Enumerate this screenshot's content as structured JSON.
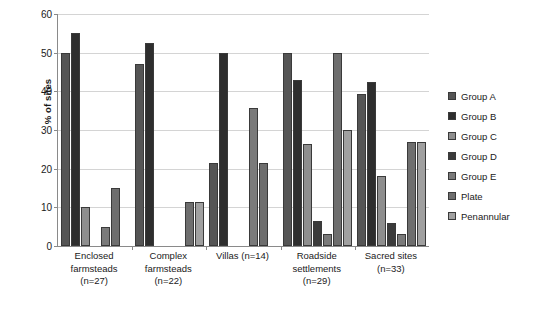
{
  "chart_data": {
    "type": "bar",
    "title": "",
    "xlabel": "",
    "ylabel": "% of sites",
    "ylim": [
      0,
      60
    ],
    "yticks": [
      0,
      10,
      20,
      30,
      40,
      50,
      60
    ],
    "grid": true,
    "legend_position": "right",
    "categories": [
      "Enclosed farmsteads (n=27)",
      "Complex farmsteads (n=22)",
      "Villas (n=14)",
      "Roadside settlements (n=29)",
      "Sacred sites (n=33)"
    ],
    "category_label_lines": [
      [
        "Enclosed",
        "farmsteads",
        "(n=27)"
      ],
      [
        "Complex",
        "farmsteads",
        "(n=22)"
      ],
      [
        "Villas (n=14)"
      ],
      [
        "Roadside",
        "settlements",
        "(n=29)"
      ],
      [
        "Sacred sites",
        "(n=33)"
      ]
    ],
    "series": [
      {
        "name": "Group A",
        "color": "#555555",
        "values": [
          50,
          47,
          21.4,
          50,
          39.4
        ]
      },
      {
        "name": "Group B",
        "color": "#2e2e2e",
        "values": [
          55,
          52.5,
          50,
          43,
          42.4
        ]
      },
      {
        "name": "Group C",
        "color": "#8e8e8e",
        "values": [
          10,
          0,
          0,
          26.5,
          18
        ]
      },
      {
        "name": "Group D",
        "color": "#3b3b3b",
        "values": [
          0,
          0,
          0,
          6.5,
          6
        ]
      },
      {
        "name": "Group E",
        "color": "#7a7a7a",
        "values": [
          5,
          0,
          35.7,
          3,
          3
        ]
      },
      {
        "name": "Plate",
        "color": "#6e6e6e",
        "values": [
          15,
          11.5,
          21.4,
          50,
          27
        ]
      },
      {
        "name": "Penannular",
        "color": "#a0a0a0",
        "values": [
          0,
          11.5,
          0,
          30,
          27
        ]
      }
    ]
  },
  "axis": {
    "y_title": "% of sites"
  },
  "colors": {
    "gridline": "#d4d4d4",
    "axis": "#8a8a8a",
    "text": "#1a1a1a",
    "background": "#ffffff"
  }
}
